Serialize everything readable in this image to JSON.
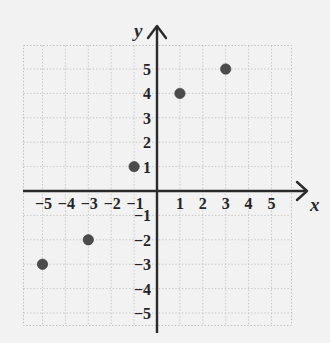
{
  "chart_data": {
    "type": "scatter",
    "title": "",
    "xlabel": "x",
    "ylabel": "y",
    "points": [
      {
        "x": -5,
        "y": -3
      },
      {
        "x": -3,
        "y": -2
      },
      {
        "x": -1,
        "y": 1
      },
      {
        "x": 1,
        "y": 4
      },
      {
        "x": 3,
        "y": 5
      }
    ],
    "xlim": [
      -5.8,
      6.0
    ],
    "ylim": [
      -6.0,
      6.2
    ],
    "x_ticks": [
      -5,
      -4,
      -3,
      -2,
      -1,
      1,
      2,
      3,
      4,
      5
    ],
    "y_ticks": [
      5,
      4,
      3,
      2,
      1,
      -1,
      -2,
      -3,
      -4,
      -5
    ],
    "x_tick_labels": [
      "−5",
      "−4",
      "−3",
      "−2",
      "−1",
      "1",
      "2",
      "3",
      "4",
      "5"
    ],
    "y_tick_labels": [
      "5",
      "4",
      "3",
      "2",
      "1",
      "−1",
      "−2",
      "−3",
      "−4",
      "−5"
    ],
    "grid": true,
    "legend": null,
    "point_color": "#4c4c4c",
    "axis_color": "#2b2b2b",
    "grid_color": "#c6c6c6",
    "background_color": "#f2f2f2"
  },
  "axes": {
    "x_name": "x",
    "y_name": "y"
  }
}
